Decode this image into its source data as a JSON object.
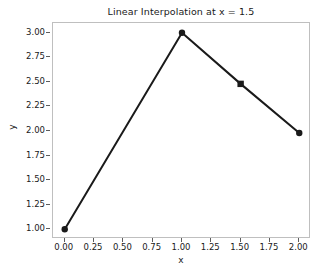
{
  "chart_data": {
    "type": "line",
    "title": "Linear Interpolation at x = 1.5",
    "xlabel": "x",
    "ylabel": "y",
    "xlim": [
      -0.1,
      2.1
    ],
    "ylim": [
      0.9,
      3.1
    ],
    "grid": false,
    "legend": null,
    "xticks": [
      0.0,
      0.25,
      0.5,
      0.75,
      1.0,
      1.25,
      1.5,
      1.75,
      2.0
    ],
    "xticklabels": [
      "0.00",
      "0.25",
      "0.50",
      "0.75",
      "1.00",
      "1.25",
      "1.50",
      "1.75",
      "2.00"
    ],
    "yticks": [
      1.0,
      1.25,
      1.5,
      1.75,
      2.0,
      2.25,
      2.5,
      2.75,
      3.0
    ],
    "yticklabels": [
      "1.00",
      "1.25",
      "1.50",
      "1.75",
      "2.00",
      "2.25",
      "2.50",
      "2.75",
      "3.00"
    ],
    "series": [
      {
        "name": "interpolated-curve",
        "type": "line",
        "color": "#1a1a1a",
        "linewidth": 2,
        "marker": "circle",
        "markersize": 6,
        "x": [
          0.0,
          1.0,
          1.5,
          2.0
        ],
        "y": [
          1.0,
          3.0,
          2.48,
          1.98
        ]
      },
      {
        "name": "interpolation-point",
        "type": "scatter",
        "color": "#1a1a1a",
        "marker": "square",
        "markersize": 6,
        "x": [
          1.5
        ],
        "y": [
          2.48
        ]
      }
    ],
    "data_points": [
      {
        "label": "p0",
        "x": 0.0,
        "y": 1.0,
        "marker": "circle"
      },
      {
        "label": "p1",
        "x": 1.0,
        "y": 3.0,
        "marker": "circle"
      },
      {
        "label": "p-interp",
        "x": 1.5,
        "y": 2.48,
        "marker": "square"
      },
      {
        "label": "p2",
        "x": 2.0,
        "y": 1.98,
        "marker": "circle"
      }
    ],
    "colors": {
      "line": "#1a1a1a",
      "marker": "#1a1a1a",
      "axes_border": "#bfbfbf",
      "tick": "#5c5c5c",
      "background": "#ffffff",
      "text": "#1a1a1a"
    }
  }
}
